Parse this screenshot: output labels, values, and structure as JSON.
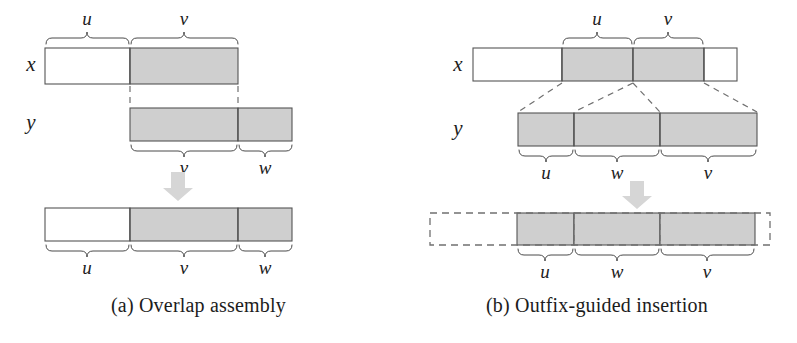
{
  "figure": {
    "width": 797,
    "height": 343,
    "background": "#ffffff",
    "ink_color": "#1c1c1c",
    "shade_color": "#cfcfcf",
    "outline_color": "#555555",
    "dash_color": "#707070",
    "arrow_color": "#d6d6d6"
  },
  "panel_a": {
    "caption": "(a) Overlap assembly",
    "row_x": {
      "label": "x",
      "segments": [
        {
          "name": "u",
          "shaded": false,
          "brace_side": "top",
          "brace_label": "u"
        },
        {
          "name": "v",
          "shaded": true,
          "brace_side": "top",
          "brace_label": "v"
        }
      ]
    },
    "row_y": {
      "label": "y",
      "segments": [
        {
          "name": "v",
          "shaded": true,
          "brace_side": "bottom",
          "brace_label": "v"
        },
        {
          "name": "w",
          "shaded": true,
          "brace_side": "bottom",
          "brace_label": "w"
        }
      ]
    },
    "row_result": {
      "label": "",
      "segments": [
        {
          "name": "u",
          "shaded": false,
          "brace_side": "bottom",
          "brace_label": "u"
        },
        {
          "name": "v",
          "shaded": true,
          "brace_side": "bottom",
          "brace_label": "v"
        },
        {
          "name": "w",
          "shaded": true,
          "brace_side": "bottom",
          "brace_label": "w"
        }
      ]
    },
    "arrow": "down-arrow",
    "alignment_guides": "dashed-vertical"
  },
  "panel_b": {
    "caption": "(b) Outfix-guided insertion",
    "row_x": {
      "label": "x",
      "segments": [
        {
          "name": "prefix",
          "shaded": false,
          "brace_side": "none",
          "brace_label": ""
        },
        {
          "name": "u",
          "shaded": true,
          "brace_side": "top",
          "brace_label": "u"
        },
        {
          "name": "v",
          "shaded": true,
          "brace_side": "top",
          "brace_label": "v"
        },
        {
          "name": "suffix",
          "shaded": false,
          "brace_side": "none",
          "brace_label": ""
        }
      ]
    },
    "row_y": {
      "label": "y",
      "segments": [
        {
          "name": "u",
          "shaded": true,
          "brace_side": "bottom",
          "brace_label": "u"
        },
        {
          "name": "w",
          "shaded": true,
          "brace_side": "bottom",
          "brace_label": "w"
        },
        {
          "name": "v",
          "shaded": true,
          "brace_side": "bottom",
          "brace_label": "v"
        }
      ]
    },
    "row_result": {
      "label": "",
      "outer_style": "dashed",
      "segments": [
        {
          "name": "u",
          "shaded": true,
          "brace_side": "bottom",
          "brace_label": "u"
        },
        {
          "name": "w",
          "shaded": true,
          "brace_side": "bottom",
          "brace_label": "w"
        },
        {
          "name": "v",
          "shaded": true,
          "brace_side": "bottom",
          "brace_label": "v"
        }
      ]
    },
    "arrow": "down-arrow",
    "alignment_guides": "dashed-diagonal"
  },
  "labels": {
    "x": "x",
    "y": "y",
    "u": "u",
    "v": "v",
    "w": "w"
  }
}
